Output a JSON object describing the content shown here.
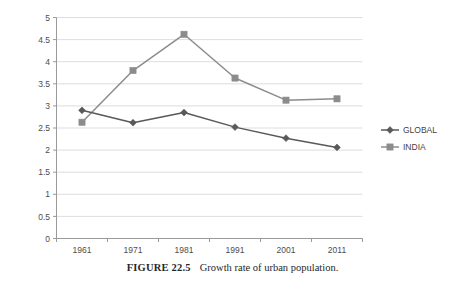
{
  "caption": {
    "figure_number": "FIGURE 22.5",
    "text": "Growth rate of urban population."
  },
  "legend": {
    "position": "right",
    "items": [
      {
        "label": "GLOBAL",
        "marker": "diamond-marker-icon",
        "color": "#595959"
      },
      {
        "label": "INDIA",
        "marker": "square-marker-icon",
        "color": "#8c8c8c"
      }
    ]
  },
  "chart_data": {
    "type": "line",
    "title": "",
    "subtitle": "",
    "xlabel": "",
    "ylabel": "",
    "categories": [
      "1961",
      "1971",
      "1981",
      "1991",
      "2001",
      "2011"
    ],
    "x": [
      1961,
      1971,
      1981,
      1991,
      2001,
      2011
    ],
    "series": [
      {
        "name": "GLOBAL",
        "color": "#595959",
        "marker": "diamond",
        "values": [
          2.9,
          2.62,
          2.85,
          2.52,
          2.27,
          2.06
        ]
      },
      {
        "name": "INDIA",
        "color": "#8c8c8c",
        "marker": "square",
        "values": [
          2.63,
          3.8,
          4.62,
          3.63,
          3.13,
          3.16
        ]
      }
    ],
    "ylim": [
      0,
      5
    ],
    "yticks": [
      "0",
      "0.5",
      "1",
      "1.5",
      "2",
      "2.5",
      "3",
      "3.5",
      "4",
      "4.5",
      "5"
    ],
    "ytick_values": [
      0,
      0.5,
      1,
      1.5,
      2,
      2.5,
      3,
      3.5,
      4,
      4.5,
      5
    ],
    "grid": true,
    "grid_axis": "y",
    "legend_position": "right"
  }
}
